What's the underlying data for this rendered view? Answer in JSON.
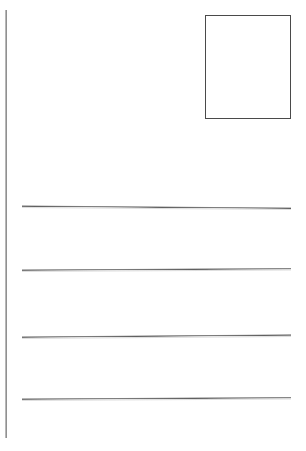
{
  "document": {
    "kind": "postcard-back-template",
    "title": "Blank Postcard Back",
    "width": 306,
    "height": 451,
    "background_color": "#ffffff"
  },
  "colors": {
    "page_background": "#ffffff",
    "rule_line": "#6f6f6f",
    "rule_line_light": "#b4b4b4",
    "stamp_border": "#4a4a4a"
  },
  "divider": {
    "name": "vertical divider line",
    "orientation": "vertical",
    "x": 5,
    "y_start": 10,
    "y_end": 438,
    "thickness": 2,
    "color": "#6f6f6f"
  },
  "stamp_area": {
    "name": "stamp placement box",
    "label": "",
    "x": 205,
    "y": 15,
    "width": 86,
    "height": 104,
    "border_color": "#4a4a4a",
    "border_width": 1,
    "fill": "#ffffff"
  },
  "address_lines": [
    {
      "index": 1,
      "label": "",
      "x_start": 22,
      "x_end": 291,
      "y": 205,
      "length": 269,
      "tilt_degrees": 0.45,
      "color": "#6f6f6f"
    },
    {
      "index": 2,
      "label": "",
      "x_start": 22,
      "x_end": 291,
      "y": 269,
      "length": 269,
      "tilt_degrees": -0.3,
      "color": "#6f6f6f"
    },
    {
      "index": 3,
      "label": "",
      "x_start": 22,
      "x_end": 291,
      "y": 336,
      "length": 269,
      "tilt_degrees": -0.45,
      "color": "#6f6f6f"
    },
    {
      "index": 4,
      "label": "",
      "x_start": 22,
      "x_end": 291,
      "y": 398,
      "length": 269,
      "tilt_degrees": -0.3,
      "color": "#6f6f6f"
    }
  ],
  "accessibility": {
    "divider_name": "Vertical divider rule",
    "stamp_name": "Stamp box",
    "lines_name": "Address writing lines"
  }
}
